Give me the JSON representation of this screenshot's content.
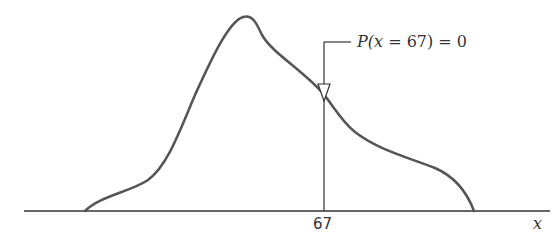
{
  "diagram": {
    "type": "continuous-probability-density",
    "callout": {
      "prefix": "P(",
      "variable": "x",
      "rest": " = 67) = 0"
    },
    "x_tick_label": "67",
    "x_axis_label": "x",
    "colors": {
      "curve": "#555555",
      "axis": "#333333",
      "text": "#333333"
    }
  }
}
